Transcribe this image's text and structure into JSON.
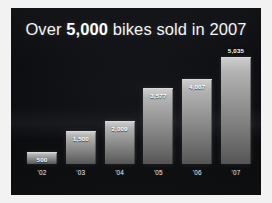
{
  "slide": {
    "title_prefix": "Over ",
    "title_emphasis": "5,000",
    "title_suffix": " bikes sold in 2007",
    "background_color": "#0a0b0d",
    "frame_color": "#f2f2f2",
    "text_color": "#f4f5f7"
  },
  "chart_data": {
    "type": "bar",
    "title": "Over 5,000 bikes sold in 2007",
    "xlabel": "",
    "ylabel": "",
    "categories": [
      "'02",
      "'03",
      "'04",
      "'05",
      "'06",
      "'07"
    ],
    "values": [
      500,
      1500,
      2009,
      3577,
      4007,
      5035
    ],
    "value_labels": [
      "500",
      "1,500",
      "2,009",
      "3,577",
      "4,007",
      "5,035"
    ],
    "ylim": [
      0,
      5500
    ],
    "grid": false,
    "legend": null,
    "series": [
      {
        "name": "Bikes sold",
        "values": [
          500,
          1500,
          2009,
          3577,
          4007,
          5035
        ]
      }
    ],
    "bar_color": "#8e8e8e",
    "label_color": "#ffffff"
  }
}
